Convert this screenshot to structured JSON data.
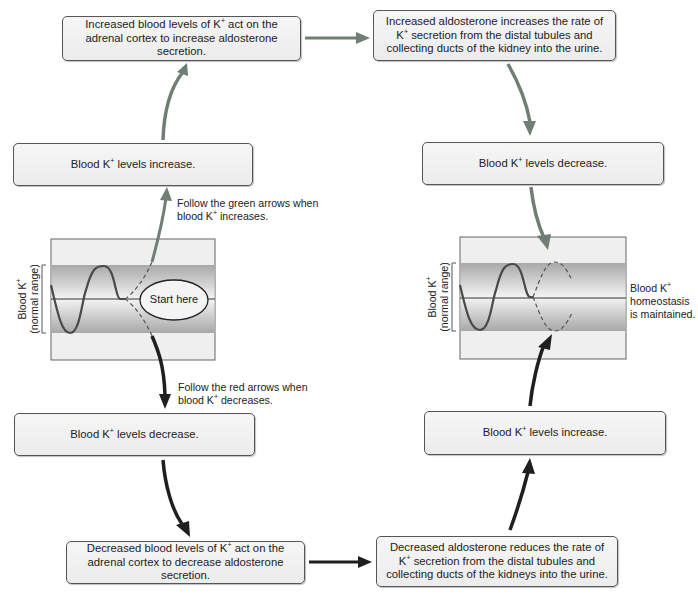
{
  "colors": {
    "green_arrow": "#6f7f73",
    "red_arrow": "#1f1f1f",
    "box_border": "#555555",
    "box_fill": "#f0f0f0",
    "band_dark": "#a9a9a9",
    "band_light": "#e2e2e2",
    "curve": "#4a4a4a"
  },
  "boxes": {
    "increase_aldosterone_secretion": {
      "pre": "Increased blood levels of K",
      "sup": "+",
      "post": " act on the adrenal cortex to increase aldosterone secretion."
    },
    "increase_k_secretion": {
      "pre": "Increased aldosterone increases the rate of K",
      "sup": "+",
      "post": " secretion from the distal tubules and collecting ducts of the kidney into the urine."
    },
    "left_levels_increase": {
      "pre": "Blood K",
      "sup": "+",
      "post": " levels increase."
    },
    "right_levels_decrease": {
      "pre": "Blood K",
      "sup": "+",
      "post": " levels decrease."
    },
    "left_levels_decrease": {
      "pre": "Blood K",
      "sup": "+",
      "post": " levels decrease."
    },
    "decrease_aldosterone_secretion": {
      "pre": "Decreased blood levels of K",
      "sup": "+",
      "post": " act on the adrenal cortex to decrease aldosterone secretion."
    },
    "reduce_k_secretion": {
      "pre": "Decreased aldosterone reduces the rate of K",
      "sup": "+",
      "post": " secretion from the distal tubules and collecting ducts of the kidneys into the urine."
    },
    "right_levels_increase": {
      "pre": "Blood K",
      "sup": "+",
      "post": " levels increase."
    }
  },
  "notes": {
    "green": {
      "line1": "Follow the green arrows when",
      "line2_pre": "blood K",
      "sup": "+",
      "line2_post": " increases."
    },
    "red": {
      "line1": "Follow the red arrows when",
      "line2_pre": "blood K",
      "sup": "+",
      "line2_post": " decreases."
    },
    "homeostasis": {
      "line1_pre": "Blood K",
      "sup": "+",
      "line2": "homeostasis",
      "line3": "is maintained."
    }
  },
  "graphs": {
    "left": {
      "ylabel_line1_pre": "Blood K",
      "sup": "+",
      "ylabel_line2": "(normal range)",
      "start_label": "Start here"
    },
    "right": {
      "ylabel_line1_pre": "Blood K",
      "sup": "+",
      "ylabel_line2": "(normal range)"
    }
  }
}
